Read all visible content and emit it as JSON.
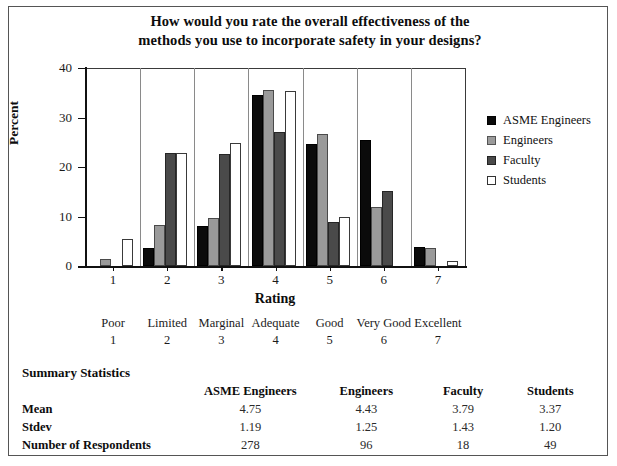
{
  "chart_data": {
    "type": "bar",
    "title": "How would you rate the overall effectiveness of the methods you use to incorporate safety in your designs?",
    "title_lines": [
      "How would you rate the overall effectiveness of the",
      "methods you use to incorporate safety in your designs?"
    ],
    "xlabel": "Rating",
    "ylabel": "Percent",
    "categories": [
      "1",
      "2",
      "3",
      "4",
      "5",
      "6",
      "7"
    ],
    "ylim": [
      0,
      40
    ],
    "yticks": [
      0,
      10,
      20,
      30,
      40
    ],
    "grid": "vertical-separators",
    "legend_position": "right",
    "series": [
      {
        "name": "ASME Engineers",
        "color": "#0b0b0b",
        "values": [
          0,
          3.7,
          8.1,
          34.5,
          24.7,
          25.4,
          3.9
        ]
      },
      {
        "name": "Engineers",
        "color": "#9a9a9a",
        "values": [
          1.5,
          8.2,
          9.6,
          35.5,
          26.7,
          11.9,
          3.7
        ]
      },
      {
        "name": "Faculty",
        "color": "#4a4a4a",
        "values": [
          0,
          22.8,
          22.7,
          27.0,
          8.9,
          15.2,
          0
        ]
      },
      {
        "name": "Students",
        "color": "#ffffff",
        "values": [
          5.5,
          22.8,
          24.8,
          35.3,
          10.0,
          0,
          1.1
        ]
      }
    ]
  },
  "scale": {
    "items": [
      {
        "label": "Poor",
        "num": "1"
      },
      {
        "label": "Limited",
        "num": "2"
      },
      {
        "label": "Marginal",
        "num": "3"
      },
      {
        "label": "Adequate",
        "num": "4"
      },
      {
        "label": "Good",
        "num": "5"
      },
      {
        "label": "Very Good",
        "num": "6"
      },
      {
        "label": "Excellent",
        "num": "7"
      }
    ]
  },
  "summary": {
    "heading": "Summary Statistics",
    "columns": [
      "ASME Engineers",
      "Engineers",
      "Faculty",
      "Students"
    ],
    "rows": [
      {
        "label": "Mean",
        "values": [
          "4.75",
          "4.43",
          "3.79",
          "3.37"
        ]
      },
      {
        "label": "Stdev",
        "values": [
          "1.19",
          "1.25",
          "1.43",
          "1.20"
        ]
      },
      {
        "label": "Number of Respondents",
        "values": [
          "278",
          "96",
          "18",
          "49"
        ]
      }
    ]
  }
}
